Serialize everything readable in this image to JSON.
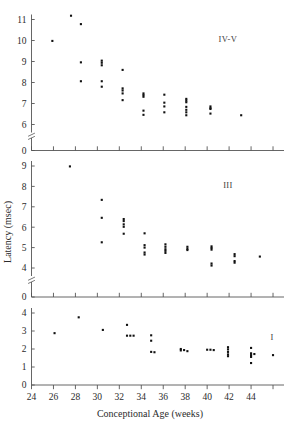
{
  "figure": {
    "xlabel": "Conceptional Age (weeks)",
    "ylabel": "Latency (msec)",
    "x_ticks": [
      "24",
      "26",
      "28",
      "30",
      "32",
      "34",
      "36",
      "38",
      "40",
      "42",
      "44"
    ],
    "x_tick_values": [
      24,
      26,
      28,
      30,
      32,
      34,
      36,
      38,
      40,
      42,
      44,
      46
    ],
    "x_unlabeled_tick_value": 46,
    "xlim": [
      24,
      47
    ],
    "grid": false,
    "legend_position": "none"
  },
  "panels": [
    {
      "label": "IV-V",
      "y_ticks": [
        "6",
        "7",
        "8",
        "9",
        "10",
        "11"
      ],
      "y_tick_values": [
        6,
        7,
        8,
        9,
        10,
        11
      ],
      "ylim": [
        5.6,
        11.5
      ],
      "baseline_label": "0",
      "axis_break": true
    },
    {
      "label": "III",
      "y_ticks": [
        "4",
        "5",
        "6",
        "7",
        "8",
        "9"
      ],
      "y_tick_values": [
        4,
        5,
        6,
        7,
        8,
        9
      ],
      "ylim": [
        3.7,
        9.4
      ],
      "baseline_label": "0",
      "axis_break": true
    },
    {
      "label": "I",
      "y_ticks": [
        "0",
        "1",
        "2",
        "3",
        "4"
      ],
      "y_tick_values": [
        0,
        1,
        2,
        3,
        4
      ],
      "ylim": [
        -0.35,
        4.2
      ],
      "baseline_label": "0",
      "axis_break": false
    }
  ],
  "chart_data": [
    {
      "type": "scatter",
      "title": "Wave IV-V latency versus conceptional age",
      "panel": "IV-V",
      "xlabel": "Conceptional Age (weeks)",
      "ylabel": "Latency (msec)",
      "xlim": [
        24,
        47
      ],
      "ylim": [
        5.6,
        11.5
      ],
      "series": [
        {
          "name": "IV-V latency",
          "points": [
            [
              25.9,
              9.98
            ],
            [
              27.6,
              11.18
            ],
            [
              28.5,
              10.78
            ],
            [
              28.5,
              8.96
            ],
            [
              28.5,
              8.06
            ],
            [
              30.4,
              9.04
            ],
            [
              30.4,
              8.94
            ],
            [
              30.4,
              8.82
            ],
            [
              30.4,
              8.06
            ],
            [
              30.4,
              7.8
            ],
            [
              32.3,
              8.6
            ],
            [
              32.3,
              7.72
            ],
            [
              32.3,
              7.62
            ],
            [
              32.3,
              7.48
            ],
            [
              32.3,
              7.16
            ],
            [
              34.2,
              7.48
            ],
            [
              34.2,
              7.4
            ],
            [
              34.2,
              7.32
            ],
            [
              34.2,
              6.66
            ],
            [
              34.2,
              6.46
            ],
            [
              36.1,
              7.42
            ],
            [
              36.1,
              7.04
            ],
            [
              36.1,
              6.86
            ],
            [
              36.1,
              6.58
            ],
            [
              38.1,
              7.22
            ],
            [
              38.1,
              7.14
            ],
            [
              38.1,
              7.06
            ],
            [
              38.1,
              6.84
            ],
            [
              38.1,
              6.7
            ],
            [
              38.1,
              6.58
            ],
            [
              38.1,
              6.44
            ],
            [
              40.3,
              6.86
            ],
            [
              40.3,
              6.78
            ],
            [
              40.3,
              6.74
            ],
            [
              40.3,
              6.52
            ],
            [
              43.1,
              6.44
            ]
          ]
        }
      ]
    },
    {
      "type": "scatter",
      "title": "Wave III latency versus conceptional age",
      "panel": "III",
      "xlabel": "Conceptional Age (weeks)",
      "ylabel": "Latency (msec)",
      "xlim": [
        24,
        47
      ],
      "ylim": [
        3.7,
        9.4
      ],
      "series": [
        {
          "name": "III latency",
          "points": [
            [
              27.5,
              8.98
            ],
            [
              30.4,
              7.34
            ],
            [
              30.4,
              6.46
            ],
            [
              30.4,
              5.26
            ],
            [
              32.4,
              6.4
            ],
            [
              32.4,
              6.3
            ],
            [
              32.4,
              6.14
            ],
            [
              32.4,
              6.02
            ],
            [
              32.4,
              5.68
            ],
            [
              34.3,
              5.7
            ],
            [
              34.3,
              5.12
            ],
            [
              34.3,
              5.0
            ],
            [
              34.3,
              4.76
            ],
            [
              34.3,
              4.66
            ],
            [
              36.2,
              5.16
            ],
            [
              36.2,
              5.04
            ],
            [
              36.2,
              4.92
            ],
            [
              36.2,
              4.84
            ],
            [
              36.2,
              4.74
            ],
            [
              38.2,
              5.04
            ],
            [
              38.2,
              4.94
            ],
            [
              38.2,
              4.88
            ],
            [
              40.4,
              5.06
            ],
            [
              40.4,
              4.98
            ],
            [
              40.4,
              4.9
            ],
            [
              40.4,
              4.22
            ],
            [
              40.4,
              4.12
            ],
            [
              42.5,
              4.68
            ],
            [
              42.5,
              4.58
            ],
            [
              42.5,
              4.34
            ],
            [
              42.5,
              4.26
            ],
            [
              44.8,
              4.56
            ]
          ]
        }
      ]
    },
    {
      "type": "scatter",
      "title": "Wave I latency versus conceptional age",
      "panel": "I",
      "xlabel": "Conceptional Age (weeks)",
      "ylabel": "Latency (msec)",
      "xlim": [
        24,
        47
      ],
      "ylim": [
        -0.35,
        4.2
      ],
      "series": [
        {
          "name": "I latency",
          "points": [
            [
              26.1,
              2.88
            ],
            [
              28.3,
              3.76
            ],
            [
              30.5,
              3.06
            ],
            [
              32.7,
              3.34
            ],
            [
              32.7,
              2.74
            ],
            [
              33.0,
              2.74
            ],
            [
              33.3,
              2.74
            ],
            [
              34.9,
              2.76
            ],
            [
              34.9,
              2.46
            ],
            [
              34.9,
              1.84
            ],
            [
              35.2,
              1.82
            ],
            [
              37.6,
              2.0
            ],
            [
              37.6,
              1.92
            ],
            [
              37.9,
              1.94
            ],
            [
              38.2,
              1.88
            ],
            [
              40.0,
              1.96
            ],
            [
              40.3,
              1.96
            ],
            [
              40.6,
              1.94
            ],
            [
              41.9,
              2.1
            ],
            [
              41.9,
              1.98
            ],
            [
              41.9,
              1.84
            ],
            [
              41.9,
              1.7
            ],
            [
              41.9,
              1.6
            ],
            [
              44.0,
              2.06
            ],
            [
              44.0,
              1.76
            ],
            [
              44.0,
              1.66
            ],
            [
              44.0,
              1.56
            ],
            [
              44.0,
              1.22
            ],
            [
              44.3,
              1.72
            ],
            [
              46.0,
              1.66
            ]
          ]
        }
      ]
    }
  ]
}
